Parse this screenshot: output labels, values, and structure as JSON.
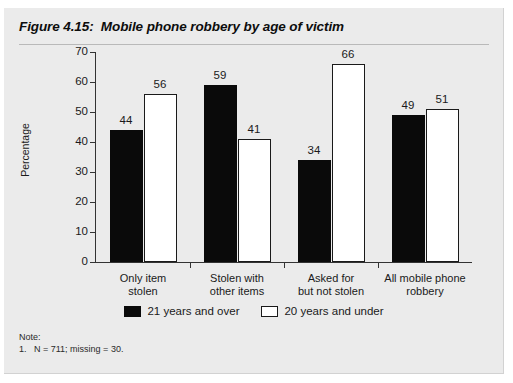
{
  "figure": {
    "title": "Figure 4.15:  Mobile phone robbery by age of victim",
    "note_heading": "Note:",
    "note_line": "1.   N = 711; missing = 30."
  },
  "legend": {
    "entries": [
      {
        "label": "21 years and over",
        "swatch": "black"
      },
      {
        "label": "20 years and under",
        "swatch": "white"
      }
    ]
  },
  "axis": {
    "y_title": "Percentage",
    "y_ticks": [
      "70",
      "60",
      "50",
      "40",
      "30",
      "20",
      "10",
      "0"
    ]
  },
  "chart_data": {
    "type": "bar",
    "title": "Mobile phone robbery by age of victim",
    "xlabel": "",
    "ylabel": "Percentage",
    "ylim": [
      0,
      70
    ],
    "ytick_interval": 10,
    "grid": false,
    "legend_position": "bottom",
    "categories": [
      "Only item stolen",
      "Stolen with other items",
      "Asked for but not stolen",
      "All mobile phone robbery"
    ],
    "category_lines": [
      [
        "Only item",
        "stolen"
      ],
      [
        "Stolen with",
        "other items"
      ],
      [
        "Asked for",
        "but not stolen"
      ],
      [
        "All mobile phone",
        "robbery"
      ]
    ],
    "series": [
      {
        "name": "21 years and over",
        "color": "#0a0a0a",
        "values": [
          44,
          59,
          34,
          49
        ]
      },
      {
        "name": "20 years and under",
        "color": "#ffffff",
        "values": [
          56,
          41,
          66,
          51
        ]
      }
    ]
  }
}
